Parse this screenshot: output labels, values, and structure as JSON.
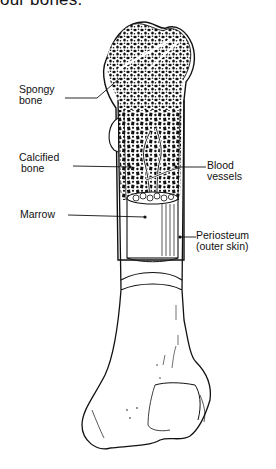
{
  "heading": "our bones.",
  "diagram": {
    "labels": {
      "spongy_bone": [
        "Spongy",
        "bone"
      ],
      "calcified_bone": [
        "Calcified",
        "bone"
      ],
      "marrow": "Marrow",
      "blood_vessels": [
        "Blood",
        "vessels"
      ],
      "periosteum": [
        "Periosteum",
        "(outer skin)"
      ]
    }
  }
}
